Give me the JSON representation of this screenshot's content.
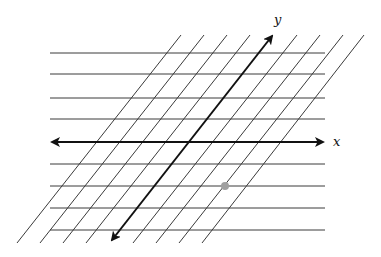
{
  "diagram": {
    "type": "skewed-coordinate-grid",
    "axes": {
      "x": {
        "label": "x",
        "direction": "horizontal",
        "double_arrow": true
      },
      "y": {
        "label": "y",
        "direction": "slanted",
        "double_arrow": true
      }
    },
    "horizontal_lines": {
      "count_above_axis": 4,
      "count_below_axis": 4
    },
    "slanted_lines": {
      "count_left_of_axis": 4,
      "count_right_of_axis": 4
    },
    "highlighted_point": {
      "color": "#a0a0a0",
      "grid_position": "x=2, y=-2"
    },
    "colors": {
      "grid": "#3a3a3a",
      "axes": "#111111",
      "point": "#a0a0a0",
      "background": "#ffffff"
    }
  }
}
